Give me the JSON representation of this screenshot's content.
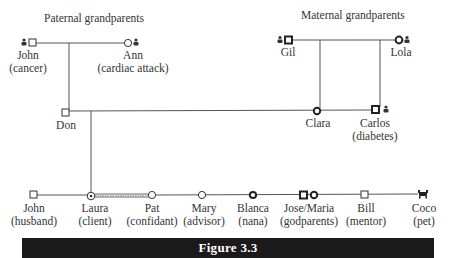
{
  "headings": {
    "paternal": "Paternal grandparents",
    "maternal": "Maternal grandparents"
  },
  "people": {
    "john_gp": {
      "name": "John",
      "note": "(cancer)",
      "symbol": "square",
      "deceased": true
    },
    "ann": {
      "name": "Ann",
      "note": "(cardiac attack)",
      "symbol": "circle",
      "deceased": true
    },
    "gil": {
      "name": "Gil",
      "note": "",
      "symbol": "square-bold",
      "deceased": true
    },
    "lola": {
      "name": "Lola",
      "note": "",
      "symbol": "circle-bold",
      "deceased": true
    },
    "don": {
      "name": "Don",
      "note": "",
      "symbol": "square"
    },
    "clara": {
      "name": "Clara",
      "note": "",
      "symbol": "circle-bold"
    },
    "carlos": {
      "name": "Carlos",
      "note": "(diabetes)",
      "symbol": "square-bold",
      "deceased": true
    },
    "john_h": {
      "name": "John",
      "note": "(husband)",
      "symbol": "square"
    },
    "laura": {
      "name": "Laura",
      "note": "(client)",
      "symbol": "circle-dot"
    },
    "pat": {
      "name": "Pat",
      "note": "(confidant)",
      "symbol": "circle"
    },
    "mary": {
      "name": "Mary",
      "note": "(advisor)",
      "symbol": "circle"
    },
    "blanca": {
      "name": "Blanca",
      "note": "(nana)",
      "symbol": "circle-bold"
    },
    "josemaria": {
      "name": "Jose/Maria",
      "note": "(godparents)",
      "symbol": "square-circle-bold"
    },
    "bill": {
      "name": "Bill",
      "note": "(mentor)",
      "symbol": "square"
    },
    "coco": {
      "name": "Coco",
      "note": "(pet)",
      "symbol": "animal"
    }
  },
  "relationships": {
    "laura_pat": "close-bond"
  },
  "figure": {
    "title": "Figure 3.3"
  },
  "colors": {
    "line": "#555555",
    "bar": "#1a1a1a",
    "bar_text": "#ffffff"
  }
}
